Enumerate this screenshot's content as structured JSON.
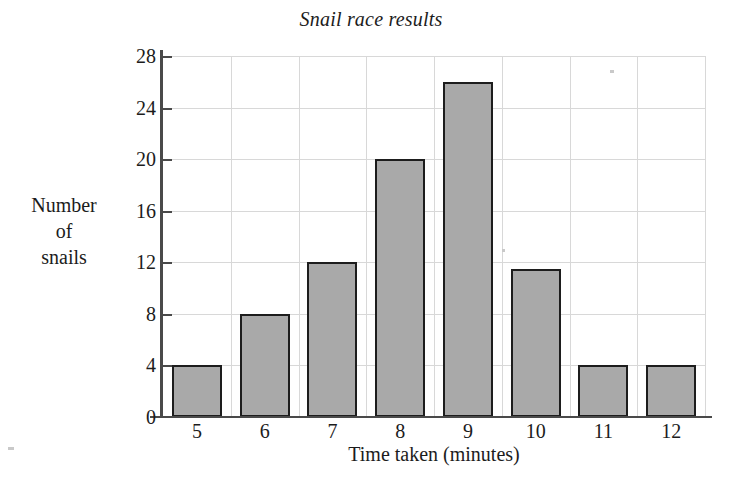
{
  "chart_data": {
    "type": "bar",
    "title": "Snail race results",
    "xlabel": "Time taken (minutes)",
    "ylabel": "Number of snails",
    "ylabel_lines": [
      "Number",
      "of",
      "snails"
    ],
    "categories": [
      "5",
      "6",
      "7",
      "8",
      "9",
      "10",
      "11",
      "12"
    ],
    "values": [
      4,
      8,
      12,
      20,
      26,
      11.5,
      4,
      4
    ],
    "series": [
      {
        "name": "Number of snails",
        "values": [
          4,
          8,
          12,
          20,
          26,
          11.5,
          4,
          4
        ]
      }
    ],
    "yticks": [
      0,
      4,
      8,
      12,
      16,
      20,
      24,
      28
    ],
    "ylim": [
      0,
      28
    ],
    "xticklabels": [
      "5",
      "6",
      "7",
      "8",
      "9",
      "10",
      "11",
      "12"
    ],
    "grid": true,
    "grid_axes": "both",
    "legend": false,
    "legend_position": "none",
    "bar_fill_color": "#a9a9a9",
    "bar_edge_color": "#1d1d1d",
    "gridline_color": "#d8d8d8",
    "axis_color": "#4a4a4a",
    "background_color": "#ffffff",
    "title_style": "italic-serif"
  }
}
